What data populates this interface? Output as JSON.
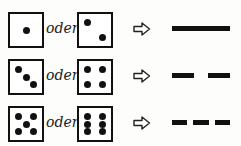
{
  "connector_word": "oder",
  "rows": [
    {
      "die_a": 1,
      "die_b": 2,
      "result": "solid line",
      "segments": 1
    },
    {
      "die_a": 3,
      "die_b": 4,
      "result": "dashed line (2 segments)",
      "segments": 2
    },
    {
      "die_a": 5,
      "die_b": 6,
      "result": "dashed line (3 segments)",
      "segments": 3
    }
  ],
  "icons": {
    "arrow": "outline-right-arrow-icon"
  },
  "colors": {
    "ink": "#111111",
    "background": "#fdfdfb"
  }
}
